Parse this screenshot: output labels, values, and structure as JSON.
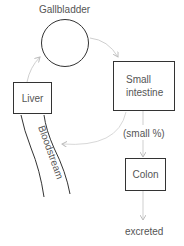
{
  "diagram": {
    "nodes": {
      "gallbladder": {
        "label": "Gallbladder",
        "shape": "circle"
      },
      "small_intestine": {
        "label": "Small\nintestine",
        "shape": "box"
      },
      "liver": {
        "label": "Liver",
        "shape": "box"
      },
      "colon": {
        "label": "Colon",
        "shape": "box"
      },
      "bloodstream": {
        "label": "Bloodstream",
        "shape": "vessel"
      },
      "excreted": {
        "label": "excreted",
        "shape": "text"
      }
    },
    "edges": [
      {
        "from": "gallbladder",
        "to": "small_intestine"
      },
      {
        "from": "small_intestine",
        "to": "bloodstream"
      },
      {
        "from": "liver",
        "to": "gallbladder"
      },
      {
        "from": "small_intestine",
        "to": "colon",
        "label": "(small %)"
      },
      {
        "from": "colon",
        "to": "excreted"
      }
    ],
    "colors": {
      "stroke": "#333333",
      "arrow": "#c8c8c8",
      "text": "#555555"
    }
  }
}
